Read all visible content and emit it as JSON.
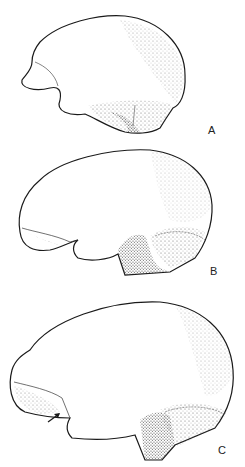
{
  "figure": {
    "panels": [
      {
        "label": "A",
        "description": "Lateral view of brain, earliest stage"
      },
      {
        "label": "B",
        "description": "Lateral view of brain, intermediate stage"
      },
      {
        "label": "C",
        "description": "Lateral view of brain, later stage with arrow marking sulcus"
      }
    ],
    "arrow_symbol": "→",
    "colors": {
      "ink": "#1a1a1a",
      "paper": "#ffffff",
      "stipple": "#555555"
    }
  }
}
